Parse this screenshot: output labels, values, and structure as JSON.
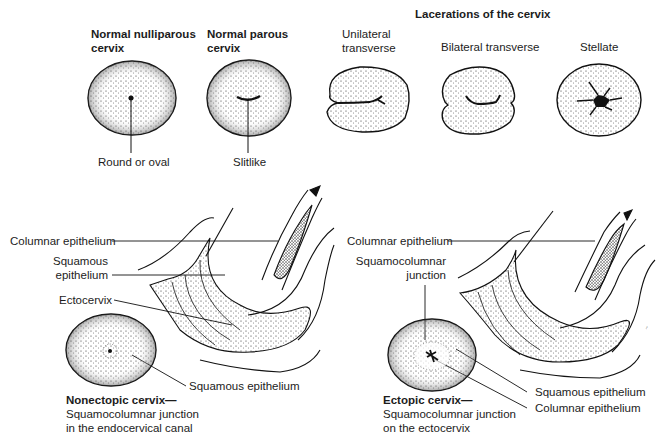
{
  "top_row": {
    "section_title": "Lacerations of the cervix",
    "normal": [
      {
        "title_line1": "Normal nulliparous",
        "title_line2": "cervix",
        "os_label": "Round or oval"
      },
      {
        "title_line1": "Normal parous",
        "title_line2": "cervix",
        "os_label": "Slitlike"
      }
    ],
    "lacerations": [
      {
        "title_line1": "Unilateral",
        "title_line2": "transverse"
      },
      {
        "title": "Bilateral transverse"
      },
      {
        "title": "Stellate"
      }
    ]
  },
  "left_panel": {
    "labels": {
      "columnar": "Columnar epithelium",
      "squamous_line1": "Squamous",
      "squamous_line2": "epithelium",
      "ectocervix": "Ectocervix",
      "squamous_epithelium": "Squamous epithelium"
    },
    "caption": {
      "title": "Nonectopic cervix—",
      "line1": "Squamocolumnar junction",
      "line2": "in the endocervical canal"
    }
  },
  "right_panel": {
    "labels": {
      "columnar": "Columnar epithelium",
      "scj_line1": "Squamocolumnar",
      "scj_line2": "junction",
      "squamous_epithelium": "Squamous epithelium",
      "columnar_epithelium": "Columnar epithelium"
    },
    "caption": {
      "title": "Ectopic cervix—",
      "line1": "Squamocolumnar junction",
      "line2": "on the ectocervix"
    }
  },
  "colors": {
    "ink": "#1a1a1a",
    "background": "#ffffff"
  }
}
